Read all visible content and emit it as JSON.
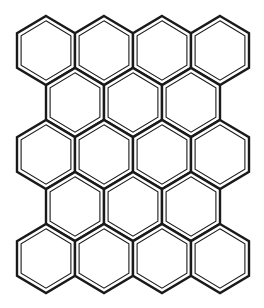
{
  "pattern": {
    "name": "hexagon-tile-pattern",
    "stroke_color": "#1a1a1a",
    "background": "#ffffff",
    "hex_width": 58,
    "hex_height": 69,
    "rows": [
      {
        "y": 50.5,
        "x": [
          46,
          104,
          162,
          220
        ]
      },
      {
        "y": 102.5,
        "x": [
          75,
          133,
          191
        ]
      },
      {
        "y": 154.5,
        "x": [
          46,
          104,
          162,
          220
        ]
      },
      {
        "y": 206.5,
        "x": [
          75,
          133,
          191
        ]
      },
      {
        "y": 258.5,
        "x": [
          46,
          104,
          162,
          220
        ]
      }
    ]
  }
}
